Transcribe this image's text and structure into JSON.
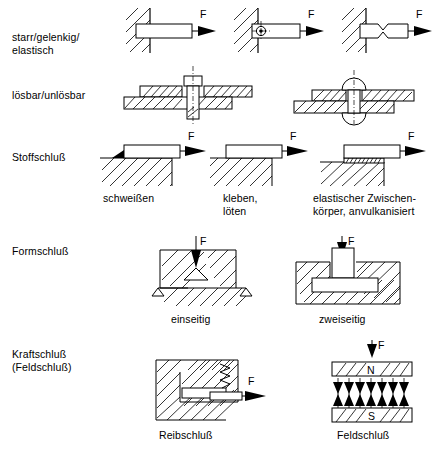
{
  "figure": {
    "width": 438,
    "height": 454,
    "background": "#ffffff",
    "ink": "#000000"
  },
  "rows": [
    {
      "id": "row-starr",
      "label": "starr/gelenkig/\nelastisch",
      "cells": [
        {
          "id": "cell-starr",
          "force_label": "F",
          "caption": ""
        },
        {
          "id": "cell-gelenkig",
          "force_label": "F",
          "caption": ""
        },
        {
          "id": "cell-elastisch",
          "force_label": "F",
          "caption": ""
        }
      ]
    },
    {
      "id": "row-loesbar",
      "label": "lösbar/unlösbar",
      "cells": [
        {
          "id": "cell-schraube",
          "force_label": "",
          "caption": ""
        },
        {
          "id": "cell-niet",
          "force_label": "",
          "caption": ""
        }
      ]
    },
    {
      "id": "row-stoffschluss",
      "label": "Stoffschluß",
      "cells": [
        {
          "id": "cell-schweissen",
          "force_label": "F",
          "caption": "schweißen"
        },
        {
          "id": "cell-kleben",
          "force_label": "F",
          "caption": "kleben,\nlöten"
        },
        {
          "id": "cell-elastischer",
          "force_label": "F",
          "caption": "elastischer Zwischen-\nkörper, anvulkanisiert"
        }
      ]
    },
    {
      "id": "row-formschluss",
      "label": "Formschluß",
      "cells": [
        {
          "id": "cell-einseitig",
          "force_label": "F",
          "caption": "einseitig"
        },
        {
          "id": "cell-zweiseitig",
          "force_label": "F",
          "caption": "zweiseitig"
        }
      ]
    },
    {
      "id": "row-kraftschluss",
      "label": "Kraftschluß\n(Feldschluß)",
      "cells": [
        {
          "id": "cell-reibschluss",
          "force_label": "F",
          "caption": "Reibschluß"
        },
        {
          "id": "cell-feldschluss",
          "force_label": "F",
          "caption": "Feldschluß",
          "pole_north": "N",
          "pole_south": "S"
        }
      ]
    }
  ],
  "labels": {
    "row_starr": "starr/gelenkig/\nelastisch",
    "row_loesbar": "lösbar/unlösbar",
    "row_stoffschluss": "Stoffschluß",
    "row_formschluss": "Formschluß",
    "row_kraftschluss": "Kraftschluß\n(Feldschluß)",
    "cap_schweissen": "schweißen",
    "cap_kleben": "kleben,\nlöten",
    "cap_elastischer": "elastischer Zwischen-\nkörper, anvulkanisiert",
    "cap_einseitig": "einseitig",
    "cap_zweiseitig": "zweiseitig",
    "cap_reibschluss": "Reibschluß",
    "cap_feldschluss": "Feldschluß",
    "f1": "F",
    "f2": "F",
    "f3": "F",
    "f_schweissen": "F",
    "f_kleben": "F",
    "f_elastischer": "F",
    "f_einseitig": "F",
    "f_zweiseitig": "F",
    "f_reibschluss": "F",
    "f_feldschluss": "F",
    "pole_n": "N",
    "pole_s": "S"
  }
}
